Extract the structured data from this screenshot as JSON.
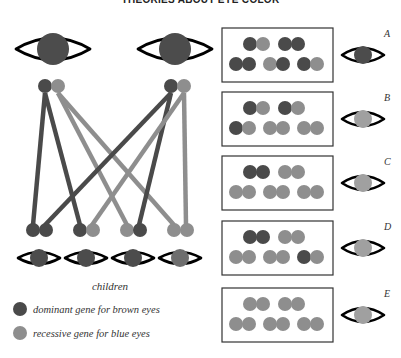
{
  "title": "THEORIES ABOUT EYE COLOR",
  "colors": {
    "dominant": "#4a4a4a",
    "recessive": "#8e8e8e",
    "eye_outline": "#000000",
    "dark_iris": "#4c4c4c",
    "medium_iris": "#6e6e6e",
    "light_iris": "#a0a0a0"
  },
  "parents": [
    {
      "label": "parent-1",
      "iris": "dark",
      "genes": [
        "dominant",
        "recessive"
      ]
    },
    {
      "label": "parent-2",
      "iris": "dark",
      "genes": [
        "dominant",
        "recessive"
      ]
    }
  ],
  "children_label": "children",
  "children": [
    {
      "genes": [
        "dominant",
        "dominant"
      ],
      "iris": "dark"
    },
    {
      "genes": [
        "dominant",
        "recessive"
      ],
      "iris": "dark"
    },
    {
      "genes": [
        "recessive",
        "dominant"
      ],
      "iris": "dark"
    },
    {
      "genes": [
        "recessive",
        "recessive"
      ],
      "iris": "medium"
    }
  ],
  "inheritance_lines": [
    {
      "from": "parent-1-dominant",
      "to": "child-1-left"
    },
    {
      "from": "parent-1-dominant",
      "to": "child-2-left"
    },
    {
      "from": "parent-1-recessive",
      "to": "child-3-left"
    },
    {
      "from": "parent-1-recessive",
      "to": "child-4-left"
    },
    {
      "from": "parent-2-dominant",
      "to": "child-1-right"
    },
    {
      "from": "parent-2-dominant",
      "to": "child-3-right"
    },
    {
      "from": "parent-2-recessive",
      "to": "child-2-right"
    },
    {
      "from": "parent-2-recessive",
      "to": "child-4-right"
    }
  ],
  "legend": [
    {
      "gene": "dominant",
      "label": "dominant gene for brown eyes"
    },
    {
      "gene": "recessive",
      "label": "recessive gene for blue eyes"
    }
  ],
  "panels": [
    {
      "letter": "A",
      "iris": "dark",
      "top": [
        "dominant",
        "recessive",
        "dominant",
        "dominant"
      ],
      "bottom": [
        "dominant",
        "dominant",
        "recessive",
        "dominant",
        "dominant",
        "recessive"
      ]
    },
    {
      "letter": "B",
      "iris": "light",
      "top": [
        "dominant",
        "recessive",
        "dominant",
        "recessive"
      ],
      "bottom": [
        "dominant",
        "recessive",
        "recessive",
        "recessive",
        "recessive",
        "recessive"
      ]
    },
    {
      "letter": "C",
      "iris": "light",
      "top": [
        "dominant",
        "dominant",
        "recessive",
        "recessive"
      ],
      "bottom": [
        "recessive",
        "recessive",
        "recessive",
        "recessive",
        "recessive",
        "recessive"
      ]
    },
    {
      "letter": "D",
      "iris": "light",
      "top": [
        "dominant",
        "dominant",
        "recessive",
        "recessive"
      ],
      "bottom": [
        "recessive",
        "recessive",
        "recessive",
        "recessive",
        "dominant",
        "recessive"
      ]
    },
    {
      "letter": "E",
      "iris": "light",
      "top": [
        "recessive",
        "recessive",
        "recessive",
        "recessive"
      ],
      "bottom": [
        "recessive",
        "recessive",
        "recessive",
        "recessive",
        "recessive",
        "recessive"
      ]
    }
  ]
}
